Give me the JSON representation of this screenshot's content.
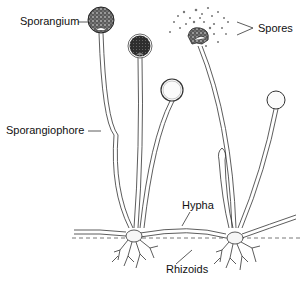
{
  "diagram": {
    "labels": {
      "sporangium": "Sporangium",
      "spores": "Spores",
      "sporangiophore": "Sporangiophore",
      "hypha": "Hypha",
      "rhizoids": "Rhizoids"
    },
    "colors": {
      "line": "#333333",
      "sporangium_dark": "#3a3a3a",
      "background": "#ffffff"
    }
  }
}
